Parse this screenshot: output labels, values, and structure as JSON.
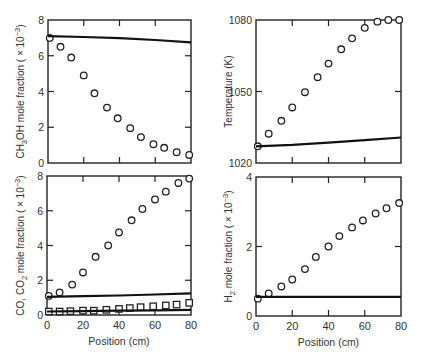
{
  "chart_data": [
    {
      "type": "scatter",
      "panel": "top-left",
      "title": "",
      "xlabel": "",
      "ylabel": "CH3OH mole fraction ( × 10^-3)",
      "ylabel_parts": {
        "pre": "CH",
        "sub": "3",
        "post": "OH mole fraction ( × 10",
        "sup": "−3",
        "end": ")"
      },
      "xlim": [
        0,
        80
      ],
      "ylim": [
        0,
        8
      ],
      "xticks": [
        0,
        20,
        40,
        60,
        80
      ],
      "yticks": [
        0,
        2,
        4,
        6,
        8
      ],
      "show_xticklabels": false,
      "frame": {
        "x0": 48,
        "y0": 20,
        "x1": 191,
        "y1": 163
      },
      "series": [
        {
          "name": "measured",
          "marker": "circle",
          "x": [
            1,
            7,
            13,
            20,
            26,
            33,
            39,
            46,
            52,
            59,
            65,
            72,
            79
          ],
          "y": [
            7.0,
            6.5,
            5.9,
            4.9,
            3.9,
            3.1,
            2.5,
            1.95,
            1.45,
            1.05,
            0.85,
            0.6,
            0.45
          ]
        },
        {
          "name": "model",
          "marker": "line",
          "x": [
            0,
            20,
            40,
            60,
            80
          ],
          "y": [
            7.1,
            7.05,
            6.98,
            6.88,
            6.75
          ]
        }
      ]
    },
    {
      "type": "scatter",
      "panel": "top-right",
      "title": "",
      "xlabel": "",
      "ylabel": "Temperature (K)",
      "xlim": [
        0,
        80
      ],
      "ylim": [
        1020,
        1080
      ],
      "xticks": [
        0,
        20,
        40,
        60,
        80
      ],
      "yticks": [
        1020,
        1050,
        1080
      ],
      "show_xticklabels": false,
      "frame": {
        "x0": 256,
        "y0": 20,
        "x1": 401,
        "y1": 163
      },
      "series": [
        {
          "name": "measured",
          "marker": "circle",
          "x": [
            1,
            7,
            14,
            20,
            27,
            34,
            40,
            47,
            53,
            60,
            67,
            73,
            79
          ],
          "y": [
            1027,
            1032.3,
            1037.7,
            1043.3,
            1049.7,
            1056,
            1061.7,
            1067.7,
            1072.3,
            1076.7,
            1079.3,
            1080,
            1080
          ]
        },
        {
          "name": "model",
          "marker": "line",
          "x": [
            0,
            20,
            40,
            60,
            80
          ],
          "y": [
            1027,
            1027.6,
            1028.5,
            1029.6,
            1030.7
          ]
        }
      ]
    },
    {
      "type": "scatter",
      "panel": "bottom-left",
      "title": "",
      "xlabel": "Position (cm)",
      "ylabel": "CO, CO2 mole fraction ( × 10^-3)",
      "ylabel_parts": {
        "pre": "CO, CO",
        "sub": "2",
        "post": " mole fraction ( × 10",
        "sup": "−3",
        "end": ")"
      },
      "xlim": [
        0,
        80
      ],
      "ylim": [
        0,
        8
      ],
      "xticks": [
        0,
        20,
        40,
        60,
        80
      ],
      "yticks": [
        0,
        2,
        4,
        6,
        8
      ],
      "show_xticklabels": true,
      "frame": {
        "x0": 47,
        "y0": 176,
        "x1": 191,
        "y1": 315
      },
      "series": [
        {
          "name": "CO measured",
          "marker": "circle",
          "x": [
            1,
            7,
            14,
            20,
            27,
            34,
            40,
            47,
            53,
            60,
            66,
            73,
            79
          ],
          "y": [
            1.1,
            1.3,
            1.75,
            2.45,
            3.35,
            4.0,
            4.75,
            5.45,
            6.1,
            6.65,
            7.1,
            7.6,
            7.85
          ]
        },
        {
          "name": "CO model",
          "marker": "line",
          "x": [
            0,
            20,
            40,
            60,
            80
          ],
          "y": [
            1.05,
            1.08,
            1.12,
            1.18,
            1.25
          ]
        },
        {
          "name": "CO2 measured",
          "marker": "square",
          "x": [
            1,
            7,
            13,
            20,
            26,
            33,
            40,
            46,
            52,
            59,
            66,
            72,
            79
          ],
          "y": [
            0.2,
            0.2,
            0.22,
            0.25,
            0.25,
            0.3,
            0.35,
            0.4,
            0.45,
            0.5,
            0.55,
            0.6,
            0.7
          ]
        },
        {
          "name": "CO2 model",
          "marker": "line",
          "x": [
            0,
            20,
            40,
            60,
            80
          ],
          "y": [
            0.2,
            0.22,
            0.25,
            0.27,
            0.3
          ]
        }
      ]
    },
    {
      "type": "scatter",
      "panel": "bottom-right",
      "title": "",
      "xlabel": "Position (cm)",
      "ylabel": "H2 mole fraction ( × 10^-3)",
      "ylabel_parts": {
        "pre": "H",
        "sub": "2",
        "post": " mole fraction ( × 10",
        "sup": "−3",
        "end": ")"
      },
      "xlim": [
        0,
        80
      ],
      "ylim": [
        0,
        4
      ],
      "xticks": [
        0,
        20,
        40,
        60,
        80
      ],
      "yticks": [
        0,
        2,
        4
      ],
      "show_xticklabels": true,
      "frame": {
        "x0": 256,
        "y0": 177,
        "x1": 401,
        "y1": 316
      },
      "series": [
        {
          "name": "measured",
          "marker": "circle",
          "x": [
            1,
            7,
            14,
            20,
            27,
            33,
            40,
            46,
            53,
            59,
            66,
            72,
            79
          ],
          "y": [
            0.5,
            0.65,
            0.85,
            1.05,
            1.35,
            1.7,
            2.0,
            2.3,
            2.55,
            2.75,
            2.95,
            3.1,
            3.25
          ]
        },
        {
          "name": "model",
          "marker": "line",
          "x": [
            0,
            20,
            40,
            60,
            80
          ],
          "y": [
            0.55,
            0.55,
            0.55,
            0.55,
            0.55
          ]
        }
      ]
    }
  ]
}
